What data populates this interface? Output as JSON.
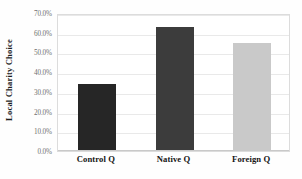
{
  "chart_data": {
    "type": "bar",
    "title": "",
    "xlabel": "",
    "ylabel": "Local Charity Choice",
    "categories": [
      "Control Q",
      "Native Q",
      "Foreign Q"
    ],
    "values": [
      34.0,
      63.0,
      55.0
    ],
    "value_labels": [
      "34.0%",
      "63.0%",
      "55.0%"
    ],
    "ylim": [
      0,
      70
    ],
    "ytick_values": [
      0,
      10,
      20,
      30,
      40,
      50,
      60,
      70
    ],
    "ytick_labels": [
      "0.0%",
      "10.0%",
      "20.0%",
      "30.0%",
      "40.0%",
      "50.0%",
      "60.0%",
      "70.0%"
    ],
    "grid": true,
    "legend": false,
    "legend_position": "none",
    "bar_colors": [
      "#262626",
      "#3c3c3c",
      "#c9c9c9"
    ],
    "plot_border_color": "#dcdcdc",
    "gridline_color": "#e9e9e9",
    "tick_label_color": "#6f6f6f",
    "axis_title_color": "#1d1d1d"
  }
}
